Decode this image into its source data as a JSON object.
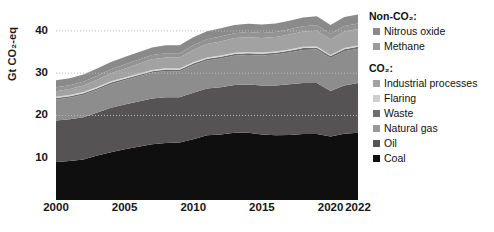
{
  "chart_data": {
    "type": "area",
    "stacked": true,
    "title": "",
    "xlabel": "",
    "ylabel": "Gt CO₂-eq",
    "xlim": [
      2000,
      2022
    ],
    "ylim": [
      0,
      44
    ],
    "yticks": [
      10,
      20,
      30,
      40
    ],
    "ytick_labels": [
      "10",
      "20",
      "30",
      "40"
    ],
    "xticks": [
      2000,
      2005,
      2010,
      2015,
      2020,
      2022
    ],
    "xtick_labels": [
      "2000",
      "2005",
      "2010",
      "2015",
      "2020",
      "2022"
    ],
    "grid": "horizontal-dotted",
    "legend_position": "right",
    "x": [
      2000,
      2001,
      2002,
      2003,
      2004,
      2005,
      2006,
      2007,
      2008,
      2009,
      2010,
      2011,
      2012,
      2013,
      2014,
      2015,
      2016,
      2017,
      2018,
      2019,
      2020,
      2021,
      2022
    ],
    "stack_order_bottom_to_top": [
      "Coal",
      "Oil",
      "Natural gas",
      "Waste",
      "Flaring",
      "Industrial processes",
      "Methane",
      "Nitrous oxide"
    ],
    "series": [
      {
        "name": "Coal",
        "group": "CO₂",
        "color": "#100f0f",
        "values": [
          9.0,
          9.2,
          9.6,
          10.5,
          11.3,
          12.0,
          12.6,
          13.2,
          13.5,
          13.6,
          14.4,
          15.3,
          15.5,
          15.9,
          15.9,
          15.5,
          15.3,
          15.4,
          15.6,
          15.6,
          15.0,
          15.7,
          15.9
        ]
      },
      {
        "name": "Oil",
        "group": "CO₂",
        "color": "#555353",
        "values": [
          9.8,
          9.9,
          10.0,
          10.2,
          10.5,
          10.6,
          10.7,
          10.8,
          10.8,
          10.7,
          11.0,
          11.1,
          11.2,
          11.3,
          11.4,
          11.6,
          11.8,
          12.0,
          12.1,
          12.1,
          10.8,
          11.4,
          11.8
        ]
      },
      {
        "name": "Natural gas",
        "group": "CO₂",
        "color": "#8e8d8d",
        "values": [
          5.0,
          5.1,
          5.3,
          5.4,
          5.6,
          5.7,
          5.9,
          6.1,
          6.2,
          6.1,
          6.5,
          6.6,
          6.8,
          6.9,
          7.0,
          7.1,
          7.3,
          7.5,
          7.8,
          7.9,
          7.8,
          8.1,
          8.1
        ]
      },
      {
        "name": "Waste",
        "group": "CO₂",
        "color": "#6f6e6e",
        "values": [
          0.35,
          0.35,
          0.36,
          0.36,
          0.37,
          0.37,
          0.38,
          0.38,
          0.39,
          0.39,
          0.4,
          0.4,
          0.41,
          0.41,
          0.42,
          0.42,
          0.43,
          0.43,
          0.44,
          0.44,
          0.44,
          0.45,
          0.45
        ]
      },
      {
        "name": "Flaring",
        "group": "CO₂",
        "color": "#d8d7d7",
        "values": [
          0.3,
          0.3,
          0.3,
          0.3,
          0.3,
          0.3,
          0.3,
          0.3,
          0.3,
          0.3,
          0.3,
          0.3,
          0.3,
          0.3,
          0.3,
          0.3,
          0.3,
          0.3,
          0.3,
          0.3,
          0.28,
          0.3,
          0.3
        ]
      },
      {
        "name": "Industrial processes",
        "group": "CO₂",
        "color": "#a3a2a2",
        "values": [
          1.3,
          1.4,
          1.5,
          1.7,
          1.9,
          2.1,
          2.3,
          2.5,
          2.5,
          2.6,
          2.9,
          3.2,
          3.3,
          3.5,
          3.5,
          3.4,
          3.4,
          3.5,
          3.6,
          3.7,
          3.7,
          3.9,
          3.9
        ]
      },
      {
        "name": "Methane",
        "group": "Non-CO₂",
        "color": "#949393",
        "values": [
          0.9,
          0.9,
          0.9,
          0.95,
          0.95,
          1.0,
          1.0,
          1.0,
          1.05,
          1.05,
          1.1,
          1.1,
          1.15,
          1.15,
          1.2,
          1.2,
          1.2,
          1.25,
          1.25,
          1.3,
          1.3,
          1.3,
          1.3
        ]
      },
      {
        "name": "Nitrous oxide",
        "group": "Non-CO₂",
        "color": "#8b8a8a",
        "values": [
          1.65,
          1.65,
          1.7,
          1.7,
          1.75,
          1.75,
          1.8,
          1.8,
          1.85,
          1.85,
          1.9,
          1.9,
          1.95,
          1.95,
          2.0,
          2.0,
          2.05,
          2.05,
          2.1,
          2.1,
          2.1,
          2.15,
          2.15
        ]
      }
    ],
    "totals": [
      28.3,
      28.8,
      29.7,
      31.1,
      32.6,
      33.8,
      35.0,
      36.1,
      36.6,
      36.6,
      38.5,
      39.9,
      40.6,
      41.4,
      41.7,
      41.5,
      41.8,
      42.4,
      43.2,
      43.4,
      41.4,
      43.3,
      43.9
    ],
    "legend": [
      {
        "group_label": "Non-CO₂:",
        "items": [
          {
            "label": "Nitrous oxide",
            "color": "#8b8a8a"
          },
          {
            "label": "Methane",
            "color": "#9c9b9b"
          }
        ]
      },
      {
        "group_label": "CO₂:",
        "items": [
          {
            "label": "Industrial processes",
            "color": "#a3a2a2"
          },
          {
            "label": "Flaring",
            "color": "#cfcece"
          },
          {
            "label": "Waste",
            "color": "#6f6e6e"
          },
          {
            "label": "Natural gas",
            "color": "#9a9999"
          },
          {
            "label": "Oil",
            "color": "#555353"
          },
          {
            "label": "Coal",
            "color": "#100f0f"
          }
        ]
      }
    ]
  }
}
